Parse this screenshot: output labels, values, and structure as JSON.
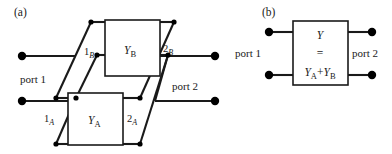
{
  "figure": {
    "panels": [
      {
        "id": "a",
        "label": "(a)",
        "port1_label": "port 1",
        "port2_label": "port 2",
        "blocks": [
          {
            "name": "Y_B",
            "label_main": "Y",
            "label_sub": "B",
            "input_terminal": "1",
            "input_terminal_sub": "B",
            "output_terminal": "2",
            "output_terminal_sub": "B"
          },
          {
            "name": "Y_A",
            "label_main": "Y",
            "label_sub": "A",
            "input_terminal": "1",
            "input_terminal_sub": "A",
            "output_terminal": "2",
            "output_terminal_sub": "A"
          }
        ]
      },
      {
        "id": "b",
        "label": "(b)",
        "port1_label": "port 1",
        "port2_label": "port 2",
        "block": {
          "name": "Y_total",
          "line1_main": "Y",
          "line2_sign": "=",
          "line3_first_main": "Y",
          "line3_first_sub": "A",
          "line3_operator": "+",
          "line3_second_main": "Y",
          "line3_second_sub": "B"
        }
      }
    ]
  },
  "style": {
    "line_color": "#1a1a1a",
    "box_fill": "#ffffff",
    "box_stroke": "#1a1a1a",
    "terminal_fill": "#000000",
    "background": "#ffffff"
  }
}
